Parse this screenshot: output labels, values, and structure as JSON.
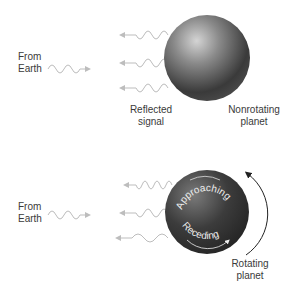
{
  "panels": [
    {
      "name": "nonrotating",
      "source_label": [
        "From",
        "Earth"
      ],
      "reflected_label": [
        "Reflected",
        "signal"
      ],
      "planet_label": [
        "Nonrotating",
        "planet"
      ]
    },
    {
      "name": "rotating",
      "source_label": [
        "From",
        "Earth"
      ],
      "approaching_label": "Approaching",
      "receding_label": "Receding",
      "planet_label": [
        "Rotating",
        "planet"
      ]
    }
  ],
  "colors": {
    "wave": "#bdbdbd",
    "planet_light": "#bfbfbf",
    "planet_dark": "#2a2a2a",
    "text": "#3a3a3a",
    "rotation_arrow": "#222222"
  }
}
